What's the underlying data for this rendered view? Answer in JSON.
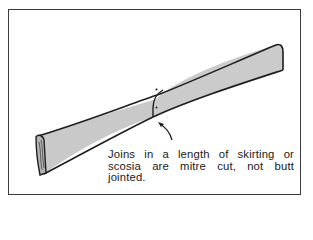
{
  "figure": {
    "caption": "Joins in a length of skirting or scosia are mitre cut, not butt jointed.",
    "colors": {
      "board_fill": "#c8c8c8",
      "outline": "#1e1e1e",
      "frame": "#3a3a3a",
      "background": "#ffffff"
    }
  }
}
